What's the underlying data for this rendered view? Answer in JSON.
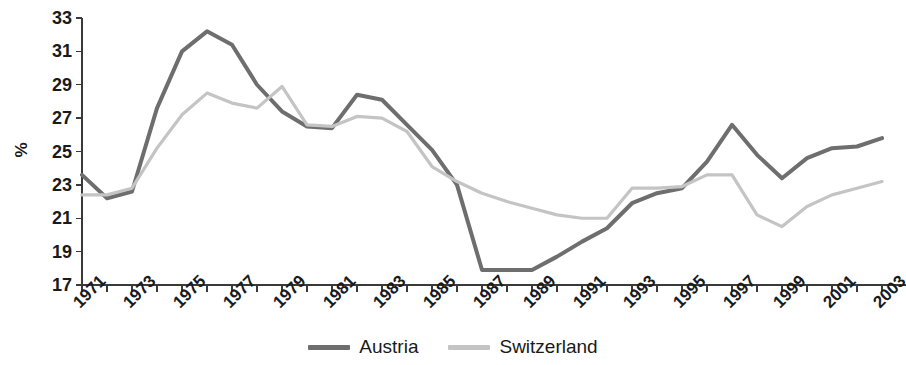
{
  "chart_data": {
    "type": "line",
    "title": "",
    "subtitle": "",
    "xlabel": "",
    "ylabel": "%",
    "ylim": [
      17,
      33
    ],
    "xlim": [
      1971,
      2003
    ],
    "grid": false,
    "legend_position": "bottom-center",
    "y_ticks": [
      17,
      19,
      21,
      23,
      25,
      27,
      29,
      31,
      33
    ],
    "y_tick_labels": [
      "17",
      "19",
      "21",
      "23",
      "25",
      "27",
      "29",
      "31",
      "33"
    ],
    "x": [
      1971,
      1972,
      1973,
      1974,
      1975,
      1976,
      1977,
      1978,
      1979,
      1980,
      1981,
      1982,
      1983,
      1984,
      1985,
      1986,
      1987,
      1988,
      1989,
      1990,
      1991,
      1992,
      1993,
      1994,
      1995,
      1996,
      1997,
      1998,
      1999,
      2000,
      2001,
      2002,
      2003
    ],
    "x_tick_labels": [
      "1971",
      "1973",
      "1975",
      "1977",
      "1979",
      "1981",
      "1983",
      "1985",
      "1987",
      "1989",
      "1991",
      "1993",
      "1995",
      "1997",
      "1999",
      "2001",
      "2003"
    ],
    "x_tick_values": [
      1971,
      1973,
      1975,
      1977,
      1979,
      1981,
      1983,
      1985,
      1987,
      1989,
      1991,
      1993,
      1995,
      1997,
      1999,
      2001,
      2003
    ],
    "series": [
      {
        "name": "Austria",
        "color": "#6e6e6e",
        "values": [
          23.6,
          22.2,
          22.6,
          27.6,
          31.0,
          32.2,
          31.4,
          29.0,
          27.4,
          26.5,
          26.4,
          28.4,
          28.1,
          26.6,
          25.1,
          23.0,
          17.9,
          17.9,
          17.9,
          18.7,
          19.6,
          20.4,
          21.9,
          22.5,
          22.8,
          24.4,
          26.6,
          24.8,
          23.4,
          24.6,
          25.2,
          25.3,
          25.8
        ]
      },
      {
        "name": "Switzerland",
        "color": "#c4c4c4",
        "values": [
          22.4,
          22.4,
          22.8,
          25.2,
          27.2,
          28.5,
          27.9,
          27.6,
          28.9,
          26.6,
          26.5,
          27.1,
          27.0,
          26.2,
          24.1,
          23.2,
          22.5,
          22.0,
          21.6,
          21.2,
          21.0,
          21.0,
          22.8,
          22.8,
          22.9,
          23.6,
          23.6,
          21.2,
          20.5,
          21.7,
          22.4,
          22.8,
          23.2
        ]
      }
    ]
  },
  "legend": {
    "entries": [
      {
        "label": "Austria",
        "color": "#6e6e6e",
        "swatch_name": "legend-swatch-austria"
      },
      {
        "label": "Switzerland",
        "color": "#c4c4c4",
        "swatch_name": "legend-swatch-switzerland"
      }
    ]
  },
  "axis": {
    "y_title": "%"
  }
}
